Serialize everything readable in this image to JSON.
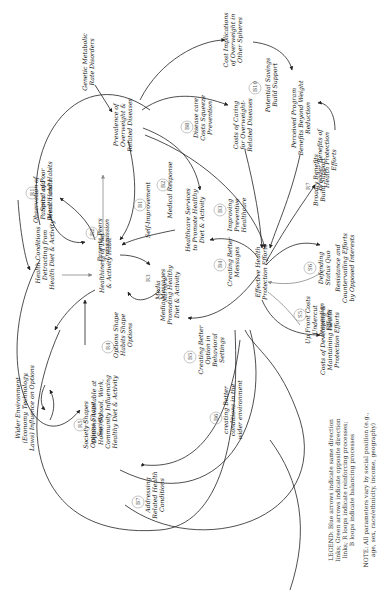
{
  "diagram": {
    "orientation": "rotated -90deg (text reads bottom to top)",
    "nodes": {
      "genetic": "Genetic Metabolic Rate Disorders",
      "prevalence": [
        "Prevalence of",
        "Overweight &",
        "Related Diseases"
      ],
      "cost_implications": [
        "Cost Implications",
        "of Overweight in",
        "Other Spheres"
      ],
      "costs_caring": [
        "Costs of Caring",
        "for Overweight-",
        "Related Diseases"
      ],
      "perceived_benefits": [
        "Perceived Program",
        "Benefits Beyond Weight",
        "Reduction"
      ],
      "broader_benefits": [
        "Broader Benefits of",
        "Health Protection",
        "Efforts"
      ],
      "health_conditions": [
        "Health Conditions",
        "Detracting from",
        "Health Diet & Activity"
      ],
      "observation": [
        "Observation of",
        "Parents' and",
        "Peers' Habits"
      ],
      "healthiness": [
        "Healthiness of Diet",
        "& Activity Habit"
      ],
      "healthcare_services": [
        "Healthcare Services",
        "to Promote Healthy",
        "Diet & Activity"
      ],
      "media_messages": [
        "Media Messages",
        "Promoting Healthy",
        "Diet & Activity"
      ],
      "effective_efforts": [
        "Effective Health",
        "Protection Efforts"
      ],
      "resistance": [
        "Resistance and",
        "Countervailing Efforts",
        "by Opposed Interests"
      ],
      "costs_developing": [
        "Costs of Developing &",
        "Maintaining Health",
        "Protection Efforts"
      ],
      "wider_environment": [
        "Wider Environment",
        "(Economy, Technology,",
        "Laws) Influence on Options"
      ],
      "options_available": [
        "Options Available at",
        "Home, School, Work,",
        "Community Influencing",
        "Healthy Diet & Activity"
      ]
    },
    "loops": [
      {
        "id": "R1",
        "label": [
          "Spiral of Poor",
          "Health and Habits"
        ]
      },
      {
        "id": "R2",
        "label": [
          "Parents Peers",
          "Transmission"
        ]
      },
      {
        "id": "R3",
        "label": [
          "Media",
          "Mirrors"
        ]
      },
      {
        "id": "R4",
        "label": [
          "Options Shape",
          "Habits Shape",
          "Options"
        ]
      },
      {
        "id": "R5",
        "label": [
          "Society Shapes",
          "Options Shape",
          "Society"
        ]
      },
      {
        "id": "B1",
        "label": [
          "Self-Improvement"
        ]
      },
      {
        "id": "B2",
        "label": [
          "Medical Response"
        ]
      },
      {
        "id": "B3",
        "label": [
          "Improving",
          "Preventive",
          "Healthcare"
        ]
      },
      {
        "id": "B4",
        "label": [
          "Creating Better",
          "Messages"
        ]
      },
      {
        "id": "B5",
        "label": [
          "Creating Better",
          "Option in",
          "Behavioral",
          "Settings"
        ]
      },
      {
        "id": "B6",
        "label": [
          "creating Better",
          "conditions in the",
          "wider environment"
        ]
      },
      {
        "id": "B7",
        "label": [
          "Addressing",
          "Related Health",
          "Conditions"
        ]
      },
      {
        "id": "B8",
        "label": [
          "Disease care",
          "Costs Squeeze",
          "Prevention"
        ]
      },
      {
        "id": "B10",
        "label": [
          "Potential Savings",
          "Build Support"
        ]
      },
      {
        "id": "R7",
        "label": [
          "Broadly Benefits",
          "Build Support"
        ]
      },
      {
        "id": "S5",
        "label": [
          "Up Front Costs",
          "Undercut",
          "Prevention",
          "Efforts"
        ]
      },
      {
        "id": "S6",
        "label": [
          "Defending",
          "Status Quo"
        ]
      }
    ],
    "legend": [
      "LEGEND: Blue arrows indicate same direction",
      "links; Green arrows indicate opposite direction",
      "links; R loops indicate reinforcing processes;",
      "B loops indicate balancing processes"
    ],
    "note": [
      "NOTE: All parameters vary by social position (e.g.,",
      "age, sex, race/ethnicity, income, geography)"
    ]
  }
}
